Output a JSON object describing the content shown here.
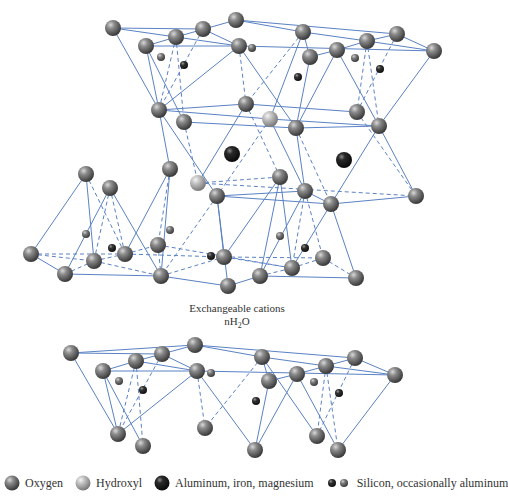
{
  "colors": {
    "bond": "#5a82c4",
    "oxygen": "#6e6e6e",
    "hydroxyl": "#b4b4b4",
    "metal": "#1e1e1e",
    "silicon_dark": "#2a2a2a",
    "silicon_light": "#6a6a6a"
  },
  "captions": {
    "line1": "Exchangeable cations",
    "line2_prefix": "nH",
    "line2_sub": "2",
    "line2_suffix": "O"
  },
  "legend": {
    "items": [
      {
        "label": "Oxygen",
        "icon": "oxygen-sphere"
      },
      {
        "label": "Hydroxyl",
        "icon": "hydroxyl-sphere"
      },
      {
        "label": "Aluminum, iron, magnesium",
        "icon": "metal-sphere"
      },
      {
        "label": "Silicon, occasionally aluminum",
        "icon": "silicon-spheres"
      }
    ]
  },
  "structure": {
    "atoms": [
      {
        "id": "t1",
        "x": 113,
        "y": 28,
        "r": 8,
        "type": "oxygen"
      },
      {
        "id": "t2",
        "x": 146,
        "y": 46,
        "r": 8,
        "type": "oxygen"
      },
      {
        "id": "t3",
        "x": 176,
        "y": 37,
        "r": 8,
        "type": "oxygen"
      },
      {
        "id": "t4",
        "x": 203,
        "y": 29,
        "r": 8,
        "type": "oxygen"
      },
      {
        "id": "t5",
        "x": 236,
        "y": 20,
        "r": 8,
        "type": "oxygen"
      },
      {
        "id": "t6",
        "x": 239,
        "y": 46,
        "r": 8,
        "type": "oxygen"
      },
      {
        "id": "t7",
        "x": 303,
        "y": 32,
        "r": 8,
        "type": "oxygen"
      },
      {
        "id": "t8",
        "x": 310,
        "y": 57,
        "r": 8,
        "type": "oxygen"
      },
      {
        "id": "t9",
        "x": 337,
        "y": 50,
        "r": 8,
        "type": "oxygen"
      },
      {
        "id": "t10",
        "x": 367,
        "y": 41,
        "r": 8,
        "type": "oxygen"
      },
      {
        "id": "t11",
        "x": 397,
        "y": 34,
        "r": 8,
        "type": "oxygen"
      },
      {
        "id": "t12",
        "x": 434,
        "y": 51,
        "r": 8,
        "type": "oxygen"
      },
      {
        "id": "ts1",
        "x": 161,
        "y": 57,
        "r": 4,
        "type": "silicon_light"
      },
      {
        "id": "ts2",
        "x": 184,
        "y": 65,
        "r": 4,
        "type": "silicon_dark"
      },
      {
        "id": "ts3",
        "x": 252,
        "y": 48,
        "r": 4,
        "type": "silicon_light"
      },
      {
        "id": "ts4",
        "x": 298,
        "y": 77,
        "r": 4,
        "type": "silicon_dark"
      },
      {
        "id": "ts5",
        "x": 355,
        "y": 58,
        "r": 4,
        "type": "silicon_light"
      },
      {
        "id": "ts6",
        "x": 380,
        "y": 69,
        "r": 4,
        "type": "silicon_dark"
      },
      {
        "id": "m1",
        "x": 159,
        "y": 110,
        "r": 8,
        "type": "oxygen"
      },
      {
        "id": "m2",
        "x": 184,
        "y": 122,
        "r": 8,
        "type": "oxygen"
      },
      {
        "id": "m3",
        "x": 246,
        "y": 104,
        "r": 8,
        "type": "oxygen"
      },
      {
        "id": "m4",
        "x": 270,
        "y": 119,
        "r": 8,
        "type": "hydroxyl"
      },
      {
        "id": "m5",
        "x": 296,
        "y": 128,
        "r": 8,
        "type": "oxygen"
      },
      {
        "id": "m6",
        "x": 357,
        "y": 112,
        "r": 8,
        "type": "oxygen"
      },
      {
        "id": "m7",
        "x": 379,
        "y": 126,
        "r": 8,
        "type": "oxygen"
      },
      {
        "id": "al1",
        "x": 232,
        "y": 154,
        "r": 8,
        "type": "metal"
      },
      {
        "id": "al2",
        "x": 344,
        "y": 160,
        "r": 8,
        "type": "metal"
      },
      {
        "id": "b1",
        "x": 86,
        "y": 174,
        "r": 8,
        "type": "oxygen"
      },
      {
        "id": "b2",
        "x": 170,
        "y": 169,
        "r": 8,
        "type": "oxygen"
      },
      {
        "id": "b3",
        "x": 110,
        "y": 188,
        "r": 8,
        "type": "oxygen"
      },
      {
        "id": "b4",
        "x": 198,
        "y": 183,
        "r": 8,
        "type": "hydroxyl"
      },
      {
        "id": "b5",
        "x": 217,
        "y": 196,
        "r": 8,
        "type": "oxygen"
      },
      {
        "id": "b6",
        "x": 280,
        "y": 177,
        "r": 8,
        "type": "oxygen"
      },
      {
        "id": "b7",
        "x": 305,
        "y": 191,
        "r": 8,
        "type": "oxygen"
      },
      {
        "id": "b8",
        "x": 331,
        "y": 204,
        "r": 8,
        "type": "oxygen"
      },
      {
        "id": "b9",
        "x": 416,
        "y": 196,
        "r": 8,
        "type": "oxygen"
      },
      {
        "id": "bs1",
        "x": 86,
        "y": 234,
        "r": 4,
        "type": "silicon_light"
      },
      {
        "id": "bs2",
        "x": 112,
        "y": 248,
        "r": 4,
        "type": "silicon_dark"
      },
      {
        "id": "bs3",
        "x": 170,
        "y": 230,
        "r": 4,
        "type": "silicon_light"
      },
      {
        "id": "bs4",
        "x": 211,
        "y": 256,
        "r": 4,
        "type": "silicon_dark"
      },
      {
        "id": "bs5",
        "x": 280,
        "y": 236,
        "r": 4,
        "type": "silicon_light"
      },
      {
        "id": "bs6",
        "x": 305,
        "y": 248,
        "r": 4,
        "type": "silicon_dark"
      },
      {
        "id": "l1",
        "x": 31,
        "y": 254,
        "r": 8,
        "type": "oxygen"
      },
      {
        "id": "l2",
        "x": 94,
        "y": 261,
        "r": 8,
        "type": "oxygen"
      },
      {
        "id": "l3",
        "x": 125,
        "y": 254,
        "r": 8,
        "type": "oxygen"
      },
      {
        "id": "l4",
        "x": 158,
        "y": 245,
        "r": 8,
        "type": "oxygen"
      },
      {
        "id": "l5",
        "x": 224,
        "y": 257,
        "r": 8,
        "type": "oxygen"
      },
      {
        "id": "l6",
        "x": 292,
        "y": 268,
        "r": 8,
        "type": "oxygen"
      },
      {
        "id": "l7",
        "x": 323,
        "y": 258,
        "r": 8,
        "type": "oxygen"
      },
      {
        "id": "l8",
        "x": 65,
        "y": 274,
        "r": 8,
        "type": "oxygen"
      },
      {
        "id": "l9",
        "x": 161,
        "y": 276,
        "r": 8,
        "type": "oxygen"
      },
      {
        "id": "l10",
        "x": 228,
        "y": 286,
        "r": 8,
        "type": "oxygen"
      },
      {
        "id": "l11",
        "x": 260,
        "y": 276,
        "r": 8,
        "type": "oxygen"
      },
      {
        "id": "l12",
        "x": 356,
        "y": 278,
        "r": 8,
        "type": "oxygen"
      },
      {
        "id": "u1",
        "x": 71,
        "y": 353,
        "r": 8,
        "type": "oxygen"
      },
      {
        "id": "u2",
        "x": 103,
        "y": 371,
        "r": 8,
        "type": "oxygen"
      },
      {
        "id": "u3",
        "x": 136,
        "y": 361,
        "r": 8,
        "type": "oxygen"
      },
      {
        "id": "u4",
        "x": 162,
        "y": 354,
        "r": 8,
        "type": "oxygen"
      },
      {
        "id": "u5",
        "x": 195,
        "y": 345,
        "r": 8,
        "type": "oxygen"
      },
      {
        "id": "u6",
        "x": 197,
        "y": 371,
        "r": 8,
        "type": "oxygen"
      },
      {
        "id": "u7",
        "x": 262,
        "y": 357,
        "r": 8,
        "type": "oxygen"
      },
      {
        "id": "u8",
        "x": 269,
        "y": 381,
        "r": 8,
        "type": "oxygen"
      },
      {
        "id": "u9",
        "x": 297,
        "y": 374,
        "r": 8,
        "type": "oxygen"
      },
      {
        "id": "u10",
        "x": 326,
        "y": 366,
        "r": 8,
        "type": "oxygen"
      },
      {
        "id": "u11",
        "x": 355,
        "y": 358,
        "r": 8,
        "type": "oxygen"
      },
      {
        "id": "u12",
        "x": 395,
        "y": 375,
        "r": 8,
        "type": "oxygen"
      },
      {
        "id": "us1",
        "x": 119,
        "y": 381,
        "r": 4,
        "type": "silicon_light"
      },
      {
        "id": "us2",
        "x": 143,
        "y": 390,
        "r": 4,
        "type": "silicon_dark"
      },
      {
        "id": "us3",
        "x": 211,
        "y": 373,
        "r": 4,
        "type": "silicon_light"
      },
      {
        "id": "us4",
        "x": 256,
        "y": 401,
        "r": 4,
        "type": "silicon_dark"
      },
      {
        "id": "us5",
        "x": 314,
        "y": 382,
        "r": 4,
        "type": "silicon_light"
      },
      {
        "id": "us6",
        "x": 339,
        "y": 393,
        "r": 4,
        "type": "silicon_dark"
      },
      {
        "id": "v1",
        "x": 118,
        "y": 434,
        "r": 8,
        "type": "oxygen"
      },
      {
        "id": "v2",
        "x": 143,
        "y": 446,
        "r": 8,
        "type": "oxygen"
      },
      {
        "id": "v3",
        "x": 205,
        "y": 428,
        "r": 8,
        "type": "oxygen"
      },
      {
        "id": "v4",
        "x": 255,
        "y": 450,
        "r": 8,
        "type": "oxygen"
      },
      {
        "id": "v5",
        "x": 317,
        "y": 436,
        "r": 8,
        "type": "oxygen"
      },
      {
        "id": "v6",
        "x": 338,
        "y": 450,
        "r": 8,
        "type": "oxygen"
      }
    ],
    "bonds": [
      [
        "t1",
        "t4",
        0
      ],
      [
        "t1",
        "t3",
        0
      ],
      [
        "t3",
        "t5",
        0
      ],
      [
        "t4",
        "t6",
        0
      ],
      [
        "t2",
        "t6",
        0
      ],
      [
        "t2",
        "t3",
        0
      ],
      [
        "t3",
        "t6",
        0
      ],
      [
        "t5",
        "t7",
        0
      ],
      [
        "t7",
        "t8",
        0
      ],
      [
        "t6",
        "t12",
        0
      ],
      [
        "t8",
        "t9",
        0
      ],
      [
        "t9",
        "t10",
        0
      ],
      [
        "t7",
        "t10",
        0
      ],
      [
        "t10",
        "t11",
        0
      ],
      [
        "t10",
        "t12",
        0
      ],
      [
        "t11",
        "t12",
        0
      ],
      [
        "t5",
        "t11",
        0
      ],
      [
        "t1",
        "m1",
        0
      ],
      [
        "t2",
        "m2",
        0
      ],
      [
        "t3",
        "m1",
        1
      ],
      [
        "t3",
        "m2",
        1
      ],
      [
        "t4",
        "m1",
        1
      ],
      [
        "t6",
        "m3",
        1
      ],
      [
        "t6",
        "m5",
        0
      ],
      [
        "t2",
        "m1",
        0
      ],
      [
        "t6",
        "m1",
        0
      ],
      [
        "t8",
        "m5",
        0
      ],
      [
        "t9",
        "m5",
        0
      ],
      [
        "t7",
        "m3",
        1
      ],
      [
        "t9",
        "m7",
        0
      ],
      [
        "t10",
        "m6",
        1
      ],
      [
        "t10",
        "m7",
        1
      ],
      [
        "t11",
        "m6",
        1
      ],
      [
        "t12",
        "m7",
        0
      ],
      [
        "t7",
        "m4",
        0
      ],
      [
        "m1",
        "m3",
        0
      ],
      [
        "m1",
        "m4",
        0
      ],
      [
        "m2",
        "m5",
        0
      ],
      [
        "m3",
        "m6",
        0
      ],
      [
        "m4",
        "m7",
        0
      ],
      [
        "m5",
        "m7",
        0
      ],
      [
        "m1",
        "b2",
        0
      ],
      [
        "m1",
        "b5",
        0
      ],
      [
        "m2",
        "b4",
        1
      ],
      [
        "m3",
        "b4",
        0
      ],
      [
        "m3",
        "b6",
        1
      ],
      [
        "m4",
        "b7",
        0
      ],
      [
        "m4",
        "b5",
        1
      ],
      [
        "m5",
        "b7",
        0
      ],
      [
        "m5",
        "b8",
        1
      ],
      [
        "m6",
        "b9",
        1
      ],
      [
        "m7",
        "b8",
        0
      ],
      [
        "m7",
        "b9",
        0
      ],
      [
        "b4",
        "b6",
        1
      ],
      [
        "b4",
        "b9",
        1
      ],
      [
        "b5",
        "b7",
        0
      ],
      [
        "b7",
        "b8",
        0
      ],
      [
        "b8",
        "b9",
        0
      ],
      [
        "b5",
        "b8",
        0
      ],
      [
        "b1",
        "l1",
        0
      ],
      [
        "b1",
        "l2",
        0
      ],
      [
        "b1",
        "l3",
        1
      ],
      [
        "b3",
        "l8",
        0
      ],
      [
        "b3",
        "l2",
        1
      ],
      [
        "b3",
        "l3",
        1
      ],
      [
        "b3",
        "l9",
        0
      ],
      [
        "b2",
        "l4",
        1
      ],
      [
        "b2",
        "l3",
        0
      ],
      [
        "b2",
        "l9",
        0
      ],
      [
        "b5",
        "l5",
        0
      ],
      [
        "b5",
        "l10",
        0
      ],
      [
        "b5",
        "l9",
        1
      ],
      [
        "b6",
        "l5",
        0
      ],
      [
        "b6",
        "l6",
        0
      ],
      [
        "b6",
        "l11",
        0
      ],
      [
        "b7",
        "l11",
        0
      ],
      [
        "b7",
        "l6",
        1
      ],
      [
        "b7",
        "l7",
        1
      ],
      [
        "b8",
        "l12",
        0
      ],
      [
        "b8",
        "l6",
        0
      ],
      [
        "l1",
        "l2",
        1
      ],
      [
        "l1",
        "l3",
        1
      ],
      [
        "l1",
        "l8",
        0
      ],
      [
        "l8",
        "l2",
        1
      ],
      [
        "l8",
        "l9",
        0
      ],
      [
        "l2",
        "l3",
        1
      ],
      [
        "l3",
        "l4",
        1
      ],
      [
        "l4",
        "l9",
        1
      ],
      [
        "l9",
        "l5",
        1
      ],
      [
        "l9",
        "l10",
        0
      ],
      [
        "l10",
        "l11",
        0
      ],
      [
        "l5",
        "l6",
        1
      ],
      [
        "l11",
        "l6",
        1
      ],
      [
        "l6",
        "l7",
        1
      ],
      [
        "l11",
        "l12",
        0
      ],
      [
        "l7",
        "l12",
        1
      ],
      [
        "l3",
        "l5",
        1
      ],
      [
        "l5",
        "l7",
        1
      ],
      [
        "l4",
        "l6",
        1
      ],
      [
        "l2",
        "l9",
        1
      ],
      [
        "u1",
        "u4",
        0
      ],
      [
        "u1",
        "u5",
        0
      ],
      [
        "u3",
        "u5",
        0
      ],
      [
        "u4",
        "u6",
        0
      ],
      [
        "u2",
        "u6",
        0
      ],
      [
        "u2",
        "u3",
        0
      ],
      [
        "u3",
        "u6",
        0
      ],
      [
        "u5",
        "u7",
        0
      ],
      [
        "u7",
        "u8",
        0
      ],
      [
        "u6",
        "u12",
        0
      ],
      [
        "u8",
        "u9",
        0
      ],
      [
        "u9",
        "u10",
        0
      ],
      [
        "u7",
        "u10",
        0
      ],
      [
        "u10",
        "u11",
        0
      ],
      [
        "u10",
        "u12",
        0
      ],
      [
        "u11",
        "u12",
        0
      ],
      [
        "u5",
        "u11",
        0
      ],
      [
        "u1",
        "v1",
        0
      ],
      [
        "u2",
        "v2",
        0
      ],
      [
        "u3",
        "v1",
        1
      ],
      [
        "u3",
        "v2",
        1
      ],
      [
        "u4",
        "v1",
        1
      ],
      [
        "u6",
        "v3",
        1
      ],
      [
        "u6",
        "v4",
        0
      ],
      [
        "u2",
        "v1",
        0
      ],
      [
        "u6",
        "v1",
        0
      ],
      [
        "u8",
        "v4",
        0
      ],
      [
        "u9",
        "v4",
        0
      ],
      [
        "u7",
        "v3",
        1
      ],
      [
        "u9",
        "v6",
        0
      ],
      [
        "u10",
        "v5",
        1
      ],
      [
        "u10",
        "v6",
        1
      ],
      [
        "u11",
        "v5",
        1
      ],
      [
        "u12",
        "v6",
        0
      ],
      [
        "u7",
        "v5",
        0
      ]
    ]
  }
}
